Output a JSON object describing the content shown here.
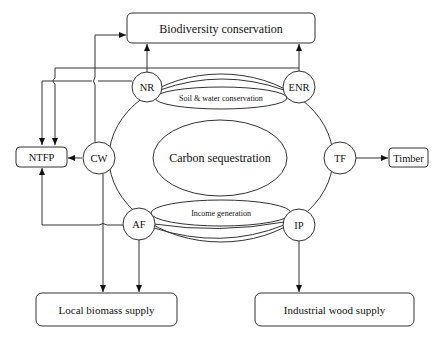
{
  "diagram": {
    "center_label": "Carbon sequestration",
    "inner_ellipses": {
      "top": "Soil & water conservation",
      "bottom": "Income generation"
    },
    "nodes": {
      "nr": "NR",
      "enr": "ENR",
      "cw": "CW",
      "tf": "TF",
      "af": "AF",
      "ip": "IP"
    },
    "outputs": {
      "biodiversity": "Biodiversity  conservation",
      "ntfp": "NTFP",
      "timber": "Timber",
      "local_biomass": "Local biomass supply",
      "industrial_wood": "Industrial wood supply"
    },
    "edges": [
      {
        "from": "NR",
        "to": "Biodiversity conservation"
      },
      {
        "from": "ENR",
        "to": "Biodiversity conservation"
      },
      {
        "from": "CW",
        "to": "Biodiversity conservation"
      },
      {
        "from": "NR",
        "to": "NTFP"
      },
      {
        "from": "ENR",
        "to": "NTFP"
      },
      {
        "from": "CW",
        "to": "NTFP"
      },
      {
        "from": "AF",
        "to": "NTFP"
      },
      {
        "from": "TF",
        "to": "Timber"
      },
      {
        "from": "CW",
        "to": "Local biomass supply"
      },
      {
        "from": "AF",
        "to": "Local biomass supply"
      },
      {
        "from": "IP",
        "to": "Industrial wood supply"
      }
    ]
  }
}
